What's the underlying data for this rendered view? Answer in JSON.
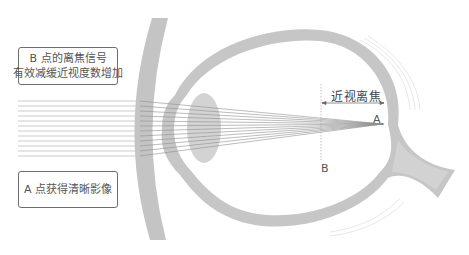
{
  "callouts": {
    "point_b": {
      "line1": "B 点的离焦信号",
      "line2": "有效减缓近视度数增加"
    },
    "point_a": {
      "text": "A 点获得清晰影像"
    }
  },
  "labels": {
    "myopic_defocus": "近视离焦",
    "point_a": "A",
    "point_b": "B"
  },
  "colors": {
    "structure_gray": "#c4c4c4",
    "ray_gray": "#9a9a9a",
    "text_gray": "#555555",
    "border_gray": "#6e6e6e"
  },
  "diagram": {
    "elements": [
      "spectacle-lens",
      "cornea",
      "crystalline-lens",
      "eyeball-wall",
      "optic-nerve",
      "light-rays",
      "focal-point-A",
      "defocus-plane-B"
    ],
    "ray_count": 12
  }
}
